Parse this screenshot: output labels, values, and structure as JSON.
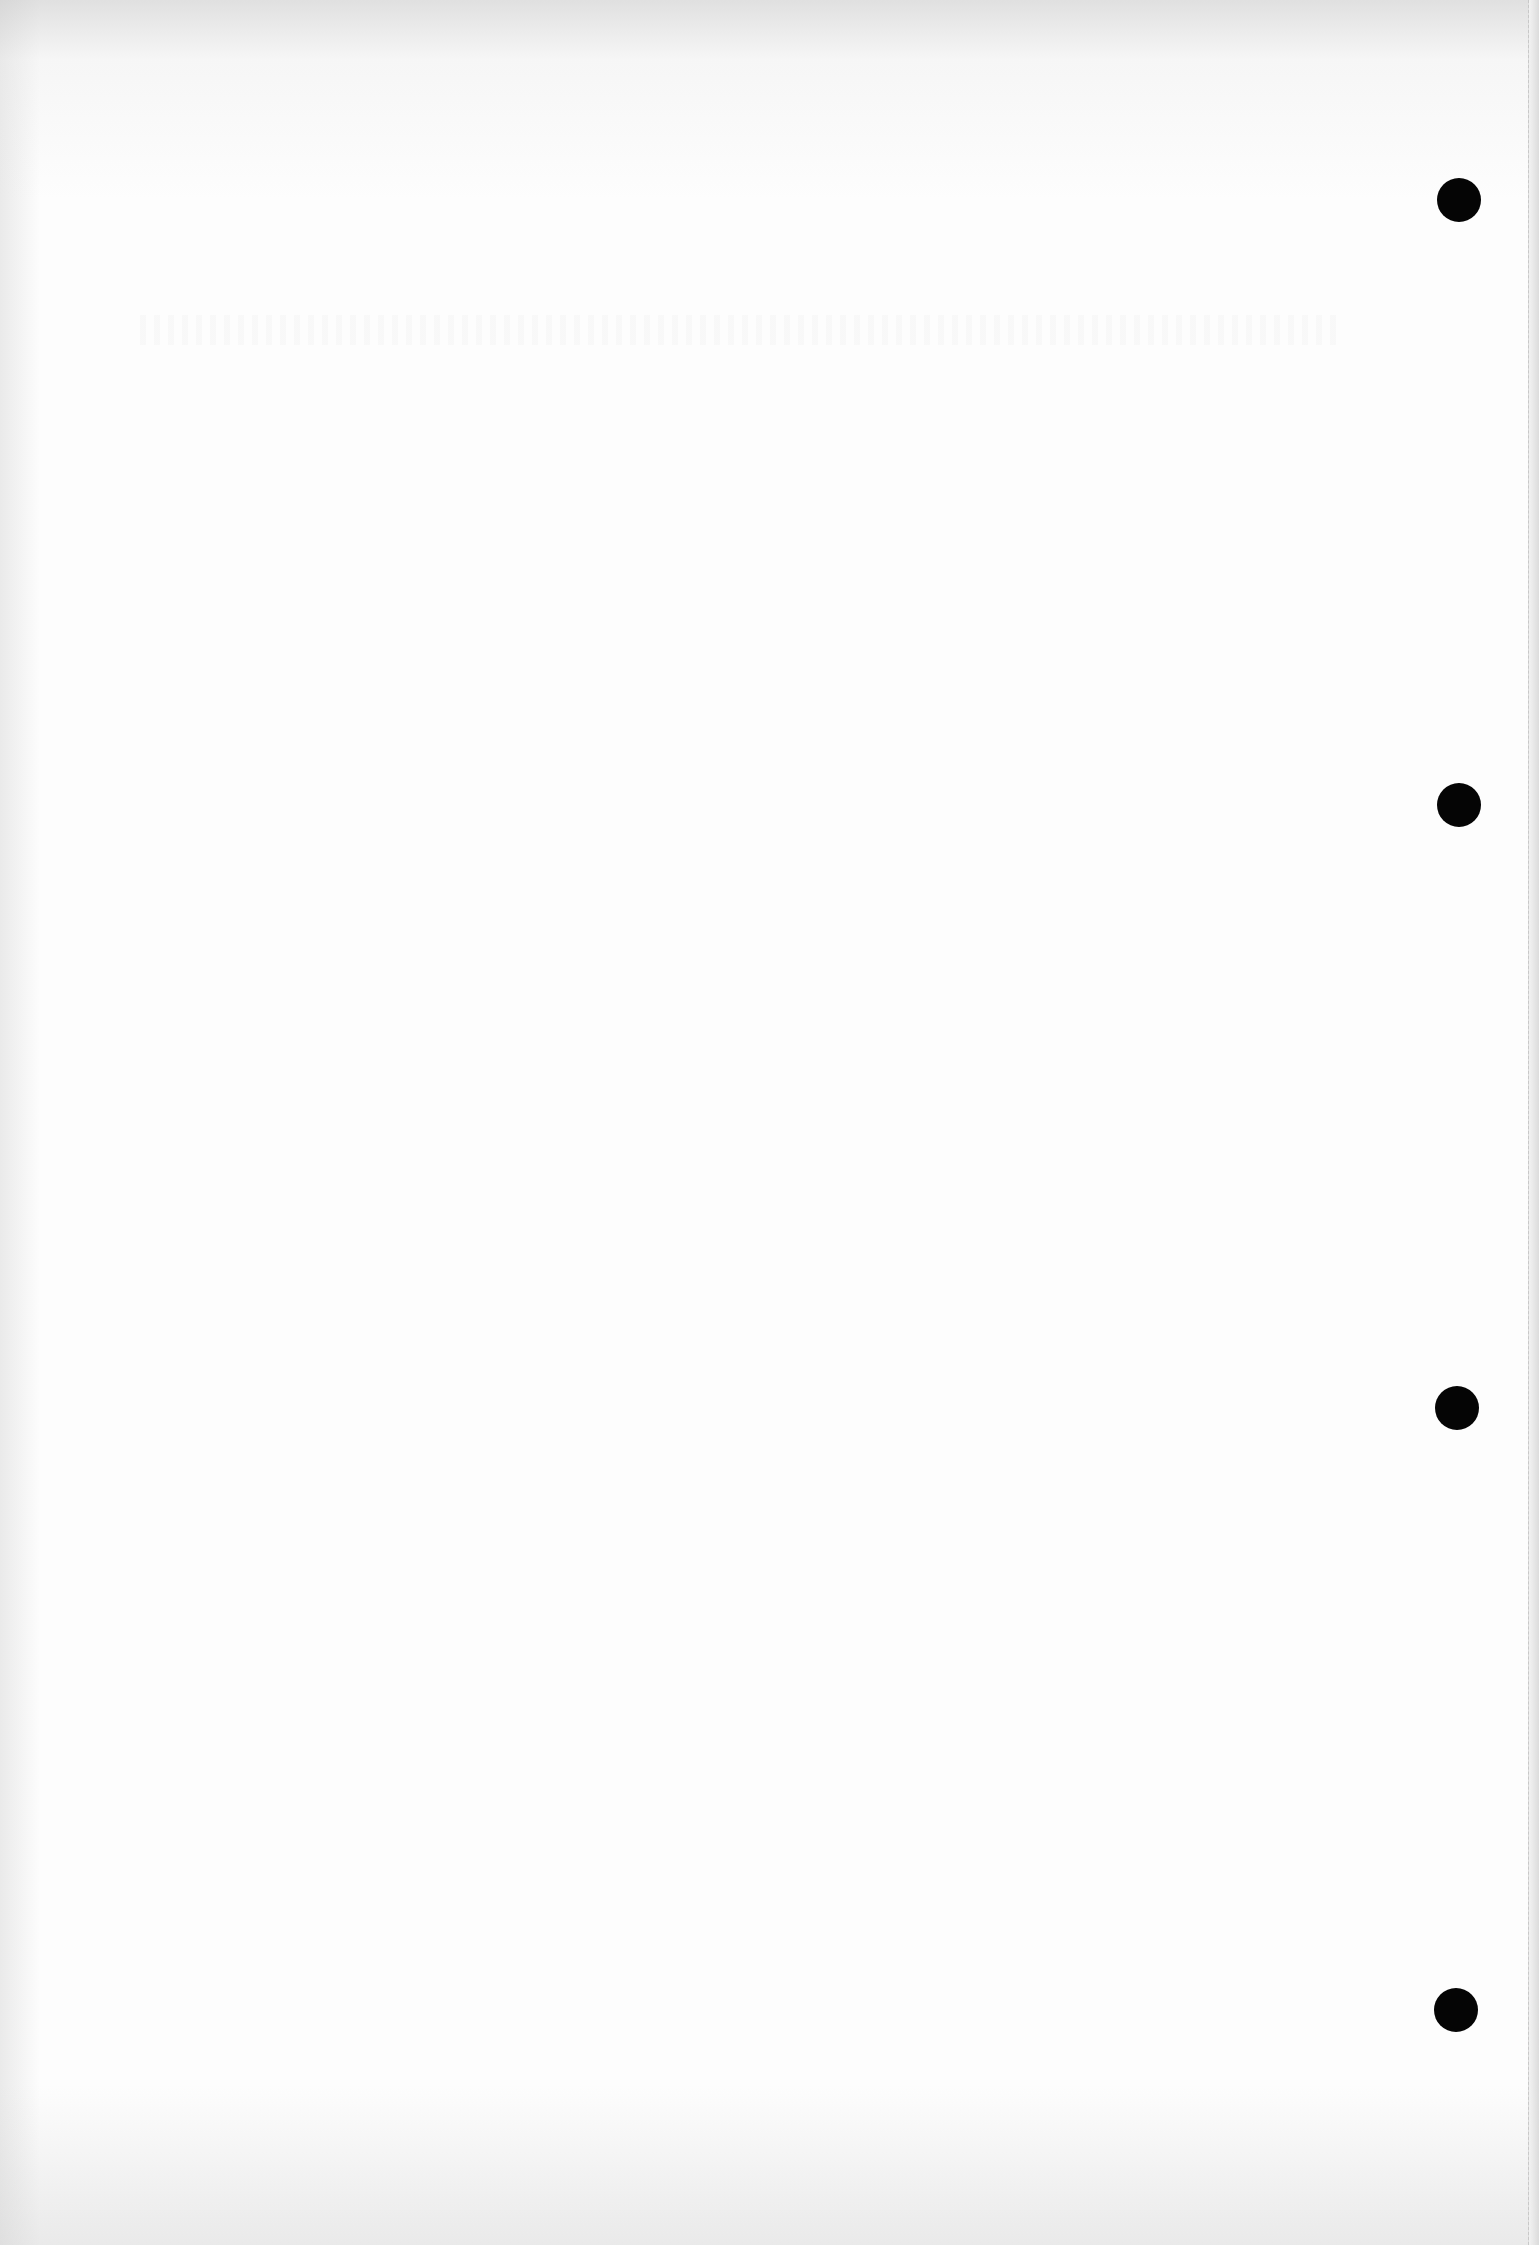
{
  "page": {
    "background_color": "#fdfdfd",
    "content_text": ""
  },
  "punch_holes": {
    "count": 4,
    "color": "#050505",
    "diameter": 44,
    "positions": [
      {
        "x": 1459,
        "y": 200
      },
      {
        "x": 1459,
        "y": 805
      },
      {
        "x": 1457,
        "y": 1408
      },
      {
        "x": 1456,
        "y": 2010
      }
    ]
  }
}
